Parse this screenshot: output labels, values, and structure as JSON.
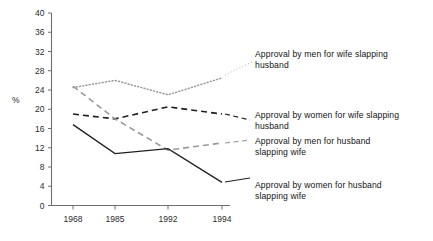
{
  "chart_data": {
    "type": "line",
    "title": "",
    "xlabel": "",
    "ylabel": "%",
    "categories": [
      "1968",
      "1985",
      "1992",
      "1994"
    ],
    "x_tick_labels": [
      "1968",
      "1985",
      "1992",
      "1994"
    ],
    "y_tick_labels": [
      "0",
      "4",
      "8",
      "12",
      "16",
      "20",
      "24",
      "28",
      "32",
      "36",
      "40"
    ],
    "y_ticks": [
      0,
      4,
      8,
      12,
      16,
      20,
      24,
      28,
      32,
      36,
      40
    ],
    "ylim": [
      0,
      40
    ],
    "grid": false,
    "legend_position": "inline-right-annotations",
    "series": [
      {
        "name": "Approval  by men for wife slapping husband",
        "style": "dotted",
        "color": "#9a9a9a",
        "values": [
          24.5,
          26.0,
          23.0,
          26.5
        ]
      },
      {
        "name": "Approval  by women for wife slapping husband",
        "style": "dashed",
        "color": "#1f1f1f",
        "values": [
          19.0,
          18.0,
          20.5,
          19.0
        ]
      },
      {
        "name": "Approval  by men for husband slapping wife",
        "style": "dashed",
        "color": "#9a9a9a",
        "values": [
          24.8,
          18.0,
          11.5,
          13.0
        ]
      },
      {
        "name": "Approval  by women for husband slapping wife",
        "style": "solid",
        "color": "#1f1f1f",
        "values": [
          16.8,
          10.8,
          11.8,
          4.8
        ]
      }
    ],
    "annotations": [
      {
        "id": "annot-men-wife-slapping-husband",
        "text": "Approval  by men for wife slapping\nhusband"
      },
      {
        "id": "annot-women-wife-slapping-husband",
        "text": "Approval  by women for wife slapping\nhusband"
      },
      {
        "id": "annot-men-husband-slapping-wife",
        "text": "Approval  by men for husband\nslapping wife"
      },
      {
        "id": "annot-women-husband-slapping-wife",
        "text": "Approval  by women for husband\nslapping wife"
      }
    ]
  }
}
